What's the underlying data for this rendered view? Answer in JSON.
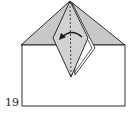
{
  "diagram": {
    "type": "origami-fold-step",
    "step_number": "19",
    "colors": {
      "paper_back": "#c8c8c8",
      "paper_front": "#ffffff",
      "line": "#1a1a1a"
    },
    "annotations": [
      {
        "kind": "valley-fold-line",
        "style": "dashed",
        "orientation": "vertical"
      },
      {
        "kind": "fold-arrow",
        "direction": "right-to-left"
      }
    ]
  }
}
